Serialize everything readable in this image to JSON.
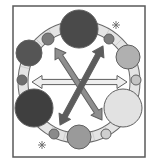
{
  "diagram": {
    "description": "Illustration of a ring with circles of varying shades placed around it and three double-headed arrows crossing the center",
    "frame": {
      "x": 13,
      "y": 6,
      "width": 132,
      "height": 151,
      "stroke": "#5a5a5a"
    },
    "ring": {
      "cx": 79,
      "cy": 82,
      "r": 56,
      "band_width": 9,
      "fill": "#e4e4e4",
      "stroke": "#6a6a6a"
    },
    "circles": [
      {
        "id": "top",
        "cx": 79,
        "cy": 29,
        "r": 19,
        "fill": "#4a4a4a"
      },
      {
        "id": "top-left-small",
        "cx": 48,
        "cy": 39,
        "r": 6,
        "fill": "#7a7a7a"
      },
      {
        "id": "left",
        "cx": 29,
        "cy": 53,
        "r": 13,
        "fill": "#555555"
      },
      {
        "id": "left-small",
        "cx": 22,
        "cy": 80,
        "r": 5,
        "fill": "#6e6e6e"
      },
      {
        "id": "bottom-left",
        "cx": 34,
        "cy": 108,
        "r": 19,
        "fill": "#3f3f3f"
      },
      {
        "id": "bottom-left-small",
        "cx": 54,
        "cy": 134,
        "r": 5,
        "fill": "#8a8a8a"
      },
      {
        "id": "bottom",
        "cx": 79,
        "cy": 137,
        "r": 12,
        "fill": "#9a9a9a"
      },
      {
        "id": "bottom-right-small",
        "cx": 106,
        "cy": 134,
        "r": 5,
        "fill": "#cfcfcf"
      },
      {
        "id": "bottom-right",
        "cx": 123,
        "cy": 108,
        "r": 19,
        "fill": "#e2e2e2"
      },
      {
        "id": "right-small",
        "cx": 136,
        "cy": 80,
        "r": 5,
        "fill": "#c4c4c4"
      },
      {
        "id": "right",
        "cx": 128,
        "cy": 57,
        "r": 12,
        "fill": "#b0b0b0"
      },
      {
        "id": "top-right-small",
        "cx": 109,
        "cy": 39,
        "r": 5,
        "fill": "#7c7c7c"
      }
    ],
    "arrows": [
      {
        "id": "horizontal",
        "x1": 32,
        "y1": 82,
        "x2": 127,
        "y2": 82,
        "fill": "#eeeeee"
      },
      {
        "id": "diagonal-medium",
        "x1": 55,
        "y1": 48,
        "x2": 102,
        "y2": 120,
        "fill": "#8e8e8e"
      },
      {
        "id": "diagonal-dark",
        "x1": 60,
        "y1": 125,
        "x2": 103,
        "y2": 46,
        "fill": "#5c5c5c"
      }
    ],
    "stars": [
      {
        "id": "star-top-right",
        "cx": 116,
        "cy": 25,
        "r": 4
      },
      {
        "id": "star-bottom-left",
        "cx": 42,
        "cy": 145,
        "r": 4
      }
    ],
    "stroke_color": "#5f5f5f"
  }
}
